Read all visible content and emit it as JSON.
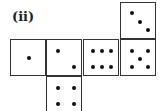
{
  "label": "(ii)",
  "net": {
    "description": "Cube net of a die with six faces",
    "faces": [
      {
        "id": "top",
        "pips": 3,
        "position": "top-right"
      },
      {
        "id": "row-1",
        "pips": 1,
        "position": "middle-1"
      },
      {
        "id": "row-2",
        "pips": 2,
        "position": "middle-2"
      },
      {
        "id": "row-3",
        "pips": 6,
        "position": "middle-3"
      },
      {
        "id": "row-4",
        "pips": 5,
        "position": "middle-4"
      },
      {
        "id": "bottom",
        "pips": 4,
        "position": "bottom-2"
      }
    ]
  }
}
